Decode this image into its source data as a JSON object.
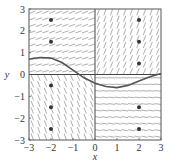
{
  "chart_data": {
    "type": "scatter",
    "subtype": "slope-field",
    "title": "",
    "xlabel": "x",
    "ylabel": "y",
    "xlim": [
      -3,
      3
    ],
    "ylim": [
      -3,
      3
    ],
    "xticks": [
      "-3",
      "-2",
      "-1",
      "0",
      "1",
      "2",
      "3"
    ],
    "yticks": [
      "-3",
      "-2",
      "-1",
      "0",
      "1",
      "2",
      "3"
    ],
    "grid": false,
    "slope_field": {
      "description": "short line segments indicating slope at lattice points",
      "quadrant_behavior": {
        "x_neg_y_pos": "nearly flat, slightly positive",
        "x_pos_y_pos": "steep positive",
        "x_neg_y_neg": "steep negative",
        "x_pos_y_neg": "nearly flat"
      },
      "color": "#9a9a9a"
    },
    "series": [
      {
        "name": "solution-curve",
        "type": "line",
        "color": "#555555",
        "x": [
          -3,
          -2.5,
          -2,
          -1.5,
          -1,
          -0.5,
          0,
          0.5,
          1,
          1.5,
          2,
          2.5,
          3
        ],
        "y": [
          0.7,
          0.78,
          0.75,
          0.55,
          0.2,
          -0.15,
          -0.4,
          -0.55,
          -0.6,
          -0.5,
          -0.3,
          -0.1,
          0.05
        ]
      },
      {
        "name": "marked-points",
        "type": "scatter",
        "color": "#333333",
        "x": [
          -2,
          -2,
          -2,
          -2,
          -2,
          2,
          2,
          2,
          2,
          2
        ],
        "y": [
          2.5,
          1.5,
          -0.5,
          -1.5,
          -2.5,
          2.5,
          1.5,
          0.5,
          -1.5,
          -2.5
        ]
      }
    ]
  }
}
